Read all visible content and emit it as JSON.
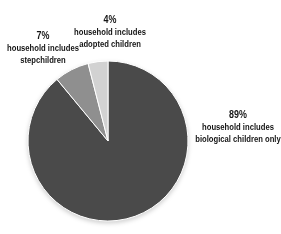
{
  "background_color": "#ffffff",
  "text_color": "#141414",
  "chart_data": {
    "type": "pie",
    "title": "",
    "legend": "none",
    "direction": "clockwise",
    "start_angle_deg": 0,
    "center": {
      "x": 108,
      "y": 141
    },
    "radius": 80,
    "separator_color": "#ffffff",
    "slices": [
      {
        "id": "biological",
        "label": "household includes biological children only",
        "value": 89,
        "color": "#4a4a4a"
      },
      {
        "id": "stepchildren",
        "label": "household includes stepchildren",
        "value": 7,
        "color": "#8f8f8f"
      },
      {
        "id": "adopted",
        "label": "household includes adopted children",
        "value": 4,
        "color": "#d2d2d2"
      }
    ]
  },
  "labels": {
    "adopted": {
      "percent": "4%",
      "line1": "household includes",
      "line2": "adopted children"
    },
    "step": {
      "percent": "7%",
      "line1": "household includes",
      "line2": "stepchildren"
    },
    "bio": {
      "percent": "89%",
      "line1": "household includes",
      "line2": "biological children only"
    }
  }
}
